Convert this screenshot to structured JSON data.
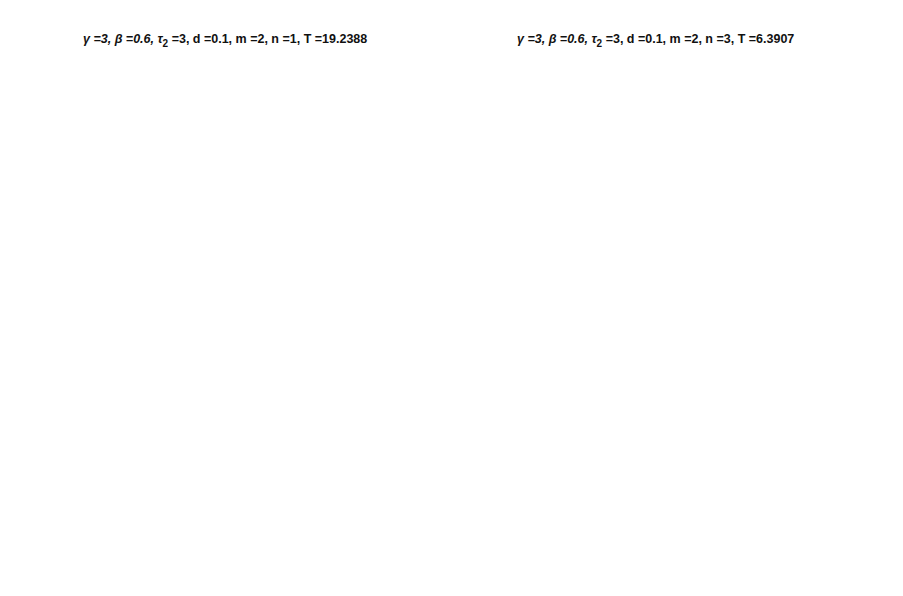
{
  "chart_data": [
    {
      "type": "line",
      "title": "γ =3, β =0.6, τ2 =3, d =0.1, m =2, n =1, T =19.2388",
      "title_parts": {
        "gamma": "3",
        "beta": "0.6",
        "tau2": "3",
        "d": "0.1",
        "m": "2",
        "n": "1",
        "T": "19.2388"
      },
      "xlabel": "Time (t)",
      "ylabel": "Solution x(t)",
      "xlim": [
        0,
        80
      ],
      "ylim": [
        -3,
        3
      ],
      "xticks": [
        0,
        10,
        20,
        30,
        40,
        50,
        60,
        70,
        80
      ],
      "yticks": [
        3,
        2,
        1,
        0,
        -1,
        -2,
        -3
      ],
      "ytick_labels": [
        "3",
        "2",
        "1",
        "0",
        "−1",
        "−2",
        "−3"
      ],
      "grid": false,
      "line_color": "#8a8a8a",
      "series": [
        {
          "name": "x(t)",
          "x": [
            0,
            1.8,
            6.2,
            11.5,
            16.4,
            20.8,
            25.0,
            30.6,
            35.2,
            39.7,
            44.3,
            49.8,
            55.0,
            59.2,
            63.6,
            69.1,
            74.5,
            78.7,
            80
          ],
          "y": [
            0,
            -1.63,
            2.6,
            -2.59,
            2.6,
            -1.63,
            2.6,
            -2.59,
            2.6,
            -1.63,
            2.6,
            -2.59,
            2.6,
            -1.63,
            2.6,
            -2.59,
            2.6,
            -1.63,
            -0.3
          ]
        }
      ]
    },
    {
      "type": "line",
      "title": "γ =3, β =0.6, τ2 =3, d =0.1, m =2, n =3, T =6.3907",
      "title_parts": {
        "gamma": "3",
        "beta": "0.6",
        "tau2": "3",
        "d": "0.1",
        "m": "2",
        "n": "3",
        "T": "6.3907"
      },
      "xlabel": "Time (t)",
      "ylabel": "Solution x(t)",
      "xlim": [
        0,
        80
      ],
      "ylim": [
        -3,
        3
      ],
      "xticks": [
        0,
        10,
        20,
        30,
        40,
        50,
        60,
        70,
        80
      ],
      "yticks": [
        3,
        2,
        1,
        0,
        -1,
        -2,
        -3
      ],
      "ytick_labels": [
        "3",
        "2",
        "1",
        "0",
        "−1",
        "−2",
        "−3"
      ],
      "grid": false,
      "line_color": "#8a8a8a",
      "series": [
        {
          "name": "x(t)",
          "x": [
            0,
            2.0,
            6.5,
            11.9,
            17.0,
            21.3,
            25.8,
            31.4,
            36.3,
            40.6,
            45.3,
            50.9,
            56.0,
            60.3,
            64.8,
            70.4,
            75.5,
            79.8,
            80
          ],
          "y": [
            0,
            -1.63,
            2.6,
            -2.59,
            2.53,
            -1.63,
            2.6,
            -2.59,
            2.53,
            -1.63,
            2.6,
            -2.59,
            2.53,
            -1.63,
            2.6,
            -2.59,
            2.53,
            -1.63,
            -1.5
          ]
        }
      ]
    }
  ],
  "panels": [
    {
      "title": {
        "gamma": "γ =3, ",
        "beta": "β =0.6, ",
        "tau": "τ",
        "tau_sub": "2",
        "rest": " =3, d =0.1, m =2, n =1, T =19.2388"
      },
      "xlabel": "Time (t)",
      "ylabel": "Solution x(t)"
    },
    {
      "title": {
        "gamma": "γ =3, ",
        "beta": "β =0.6, ",
        "tau": "τ",
        "tau_sub": "2",
        "rest": " =3, d =0.1, m =2, n =3, T =6.3907"
      },
      "xlabel": "Time (t)",
      "ylabel": "Solution x(t)"
    }
  ]
}
